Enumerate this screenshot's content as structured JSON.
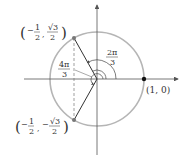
{
  "diagram": {
    "type": "unit-circle",
    "colors": {
      "circle": "#b0b0b0",
      "axes": "#555555",
      "radius_lines": "#333333",
      "points_gray": "#777777",
      "point_black": "#111111",
      "text": "#333333"
    },
    "points": {
      "upper": {
        "label_open": "(",
        "x_sign": "−",
        "x_num": "1",
        "x_den": "2",
        "sep": ",",
        "y_num": "√3",
        "y_den": "2",
        "label_close": ")"
      },
      "lower": {
        "label_open": "(",
        "x_sign": "−",
        "x_num": "1",
        "x_den": "2",
        "sep": ",",
        "y_sign": "−",
        "y_num": "√3",
        "y_den": "2",
        "label_close": ")"
      },
      "right": {
        "label": "(1, 0)"
      }
    },
    "angles": {
      "two_pi_over_three": {
        "num": "2π",
        "den": "3"
      },
      "four_pi_over_three": {
        "num": "4π",
        "den": "3"
      }
    }
  }
}
